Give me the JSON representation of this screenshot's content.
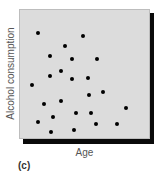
{
  "figure": {
    "panel_label": "(c)",
    "colors": {
      "plot_bg": "#dcdcdc",
      "dots": "#000000",
      "shadow": "#0a0a0a"
    }
  },
  "chart_data": {
    "type": "scatter",
    "title": "",
    "xlabel": "Age",
    "ylabel": "Alcohol consumption",
    "xlim": [
      0,
      100
    ],
    "ylim": [
      0,
      100
    ],
    "grid": false,
    "legend": null,
    "ticks": "none (unlabeled axes)",
    "points": [
      {
        "x": 14,
        "y": 82
      },
      {
        "x": 48,
        "y": 80
      },
      {
        "x": 34,
        "y": 72
      },
      {
        "x": 23,
        "y": 65
      },
      {
        "x": 40,
        "y": 62
      },
      {
        "x": 59,
        "y": 62
      },
      {
        "x": 31,
        "y": 53
      },
      {
        "x": 23,
        "y": 49
      },
      {
        "x": 40,
        "y": 47
      },
      {
        "x": 52,
        "y": 48
      },
      {
        "x": 9,
        "y": 42
      },
      {
        "x": 53,
        "y": 35
      },
      {
        "x": 63,
        "y": 37
      },
      {
        "x": 18,
        "y": 28
      },
      {
        "x": 31,
        "y": 30
      },
      {
        "x": 81,
        "y": 25
      },
      {
        "x": 25,
        "y": 18
      },
      {
        "x": 43,
        "y": 21
      },
      {
        "x": 54,
        "y": 21
      },
      {
        "x": 14,
        "y": 14
      },
      {
        "x": 58,
        "y": 12
      },
      {
        "x": 74,
        "y": 12
      },
      {
        "x": 24,
        "y": 6
      },
      {
        "x": 41,
        "y": 8
      }
    ],
    "annotations": [
      "(c)"
    ]
  }
}
